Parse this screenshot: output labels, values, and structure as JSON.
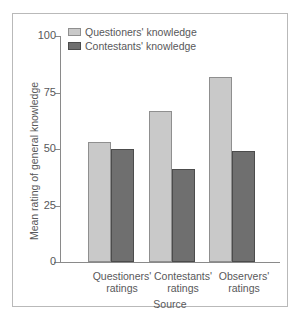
{
  "chart_data": {
    "type": "bar",
    "title": "",
    "xlabel": "Source",
    "ylabel": "Mean rating of general knowledge",
    "categories": [
      "Questioners' ratings",
      "Contestants' ratings",
      "Observers' ratings"
    ],
    "category_lines": [
      [
        "Questioners'",
        "ratings"
      ],
      [
        "Contestants'",
        "ratings"
      ],
      [
        "Observers'",
        "ratings"
      ]
    ],
    "series": [
      {
        "name": "Questioners' knowledge",
        "color": "#c9c9c9",
        "values": [
          53,
          67,
          82
        ]
      },
      {
        "name": "Contestants' knowledge",
        "color": "#6f6f6f",
        "values": [
          50,
          41,
          49
        ]
      }
    ],
    "ylim": [
      0,
      100
    ],
    "yticks": [
      0,
      25,
      50,
      75,
      100
    ],
    "ytick_labels": [
      "0",
      "25",
      "50",
      "75",
      "100"
    ],
    "grid": false,
    "legend_position": "top-left"
  },
  "legend": {
    "items": [
      {
        "label": "Questioners' knowledge",
        "swatch": "light"
      },
      {
        "label": "Contestants' knowledge",
        "swatch": "dark"
      }
    ]
  }
}
